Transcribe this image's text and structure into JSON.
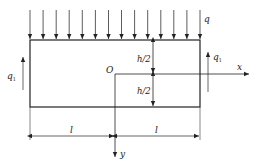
{
  "figure": {
    "caption_fragment": "",
    "labels": {
      "load_top": "q",
      "shear_left": "q",
      "shear_left_sub": "1",
      "shear_right": "q",
      "shear_right_sub": "1",
      "origin": "O",
      "x_axis": "x",
      "y_axis": "y",
      "half_height_top": "h/2",
      "half_height_bottom": "h/2",
      "length_left": "l",
      "length_right": "l"
    },
    "geometry": {
      "beam": {
        "x": 30,
        "y": 40,
        "width": 170,
        "height": 67
      },
      "distributed_load_arrow_count": 14,
      "origin_xy": [
        115,
        74
      ]
    },
    "colors": {
      "line": "#222222",
      "light_line": "#555555"
    }
  }
}
